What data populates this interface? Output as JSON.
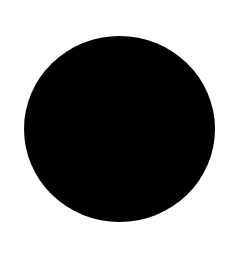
{
  "background": "#ffffff",
  "shape": {
    "type": "circle",
    "fill": "#000000",
    "cx": 119.5,
    "cy": 129,
    "rx": 95.5,
    "ry": 93
  }
}
